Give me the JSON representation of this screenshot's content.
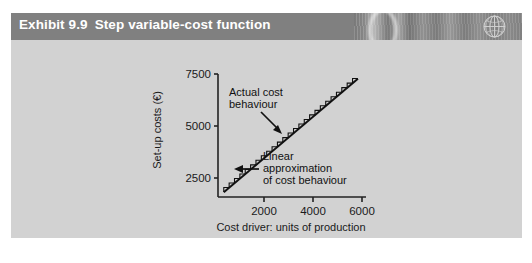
{
  "exhibit": {
    "number": "Exhibit 9.9",
    "title": "Step variable-cost function",
    "header_bg": "#808080",
    "panel_bg": "#d2d2d2",
    "globe_icon": "globe-icon"
  },
  "chart_data": {
    "type": "line",
    "title": "Step variable-cost function",
    "xlabel": "Cost driver: units of production",
    "ylabel": "Set-up costs (€)",
    "xlim": [
      0,
      6400
    ],
    "ylim": [
      0,
      7800
    ],
    "xticks": [
      2000,
      4000,
      6000
    ],
    "xtick_labels": [
      "2000",
      "4000",
      "6000"
    ],
    "yticks": [
      2500,
      5000,
      7500
    ],
    "ytick_labels": [
      "2500",
      "5000",
      "7500"
    ],
    "grid": false,
    "legend": "none",
    "series": [
      {
        "name": "Actual cost behaviour",
        "type": "step",
        "step_count": 25,
        "x_start": 250,
        "x_end": 6050,
        "y_start": 310,
        "y_end": 7510
      },
      {
        "name": "Linear approximation of cost behaviour",
        "type": "line",
        "x": [
          250,
          6050
        ],
        "y": [
          300,
          7500
        ]
      }
    ],
    "annotations": [
      {
        "name": "actual-cost-behaviour",
        "lines": [
          "Actual cost",
          "behaviour"
        ],
        "arrow": "down-right"
      },
      {
        "name": "linear-approximation",
        "lines": [
          "Linear",
          "approximation",
          "of cost behaviour"
        ],
        "arrow": "left"
      }
    ]
  }
}
